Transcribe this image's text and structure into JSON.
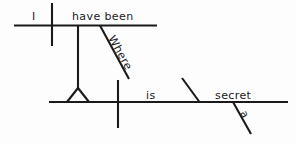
{
  "diagram": {
    "type": "reed-kellogg-sentence-diagram",
    "sentence": "I have been where a secret is",
    "canvas": {
      "width": 296,
      "height": 143,
      "background": "#fdfdfd"
    },
    "ink_color": "#1a1a1a",
    "labels": {
      "subject": "I",
      "verb": "have been",
      "conjunction": "Where",
      "dependent_verb": "is",
      "predicate_noun": "secret",
      "article": "a"
    },
    "clauses": [
      {
        "name": "main-clause",
        "baseline": {
          "x1": 14,
          "y1": 25.5,
          "x2": 157,
          "y2": 25.5
        },
        "subject_divider": {
          "x": 52,
          "y1": 3,
          "y2": 46
        },
        "words": [
          {
            "role": "subject",
            "text": "I",
            "x": 32,
            "y": 20
          },
          {
            "role": "verb",
            "text": "have been",
            "x": 72,
            "y": 20
          }
        ]
      },
      {
        "name": "subordinate-clause",
        "baseline": {
          "x1": 49,
          "y1": 102,
          "x2": 288,
          "y2": 102
        },
        "subject_divider": {
          "x": 118,
          "y1": 80,
          "y2": 128
        },
        "predicate_slant": {
          "x1": 182,
          "y1": 78,
          "x2": 199.5,
          "y2": 102
        },
        "words": [
          {
            "role": "dependent-verb",
            "text": "is",
            "x": 146,
            "y": 99
          },
          {
            "role": "predicate-noun",
            "text": "secret",
            "x": 215,
            "y": 99
          }
        ]
      }
    ],
    "connectors": [
      {
        "name": "clause-connector",
        "kind": "vertical-drop",
        "x": 78,
        "y1": 26,
        "y2": 88
      },
      {
        "name": "connector-triangle-left-leg",
        "kind": "triangle-leg",
        "x1": 78,
        "y1": 88,
        "x2": 67,
        "y2": 102
      },
      {
        "name": "connector-triangle-right-leg",
        "kind": "triangle-leg",
        "x1": 78,
        "y1": 88,
        "x2": 89,
        "y2": 102
      },
      {
        "name": "conjunction-slant",
        "kind": "modifier-slant",
        "x1": 100,
        "y1": 25.5,
        "x2": 129,
        "y2": 79,
        "label": "Where",
        "label_rotation": 61,
        "label_x": 108,
        "label_y": 38
      },
      {
        "name": "article-slant",
        "kind": "modifier-slant",
        "x1": 233,
        "y1": 102,
        "x2": 251,
        "y2": 134,
        "label": "a",
        "label_rotation": 61,
        "label_x": 240,
        "label_y": 113
      }
    ]
  }
}
